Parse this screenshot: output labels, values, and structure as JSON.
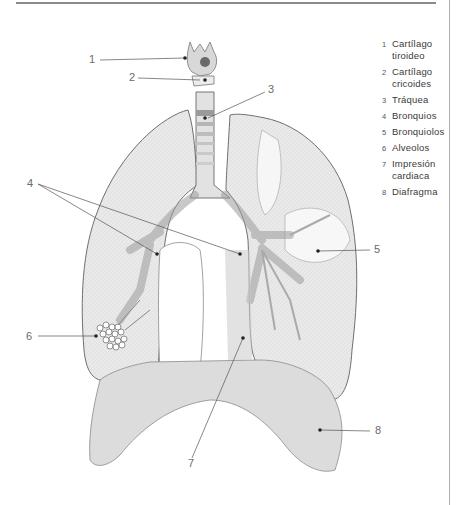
{
  "diagram": {
    "type": "anatomical-illustration",
    "colors": {
      "rule": "#8a8a8a",
      "line": "#555555",
      "lung_fill": "#e6e6e6",
      "lung_stroke": "#777777",
      "diaphragm_fill": "#d9d9d9",
      "text": "#3a3a3a"
    }
  },
  "callouts": [
    {
      "num": "1",
      "x": 95,
      "y": 52
    },
    {
      "num": "2",
      "x": 128,
      "y": 70
    },
    {
      "num": "3",
      "x": 270,
      "y": 83
    },
    {
      "num": "4",
      "x": 27,
      "y": 181
    },
    {
      "num": "5",
      "x": 375,
      "y": 242
    },
    {
      "num": "6",
      "x": 25,
      "y": 331
    },
    {
      "num": "7",
      "x": 188,
      "y": 455
    },
    {
      "num": "8",
      "x": 375,
      "y": 424
    }
  ],
  "legend": [
    {
      "num": "1",
      "label_l1": "Cartílago",
      "label_l2": "tiroideo"
    },
    {
      "num": "2",
      "label_l1": "Cartílago",
      "label_l2": "cricoides"
    },
    {
      "num": "3",
      "label_l1": "Tráquea",
      "label_l2": ""
    },
    {
      "num": "4",
      "label_l1": "Bronquios",
      "label_l2": ""
    },
    {
      "num": "5",
      "label_l1": "Bronquiolos",
      "label_l2": ""
    },
    {
      "num": "6",
      "label_l1": "Alveolos",
      "label_l2": ""
    },
    {
      "num": "7",
      "label_l1": "Impresión",
      "label_l2": "cardiaca"
    },
    {
      "num": "8",
      "label_l1": "Diafragma",
      "label_l2": ""
    }
  ]
}
